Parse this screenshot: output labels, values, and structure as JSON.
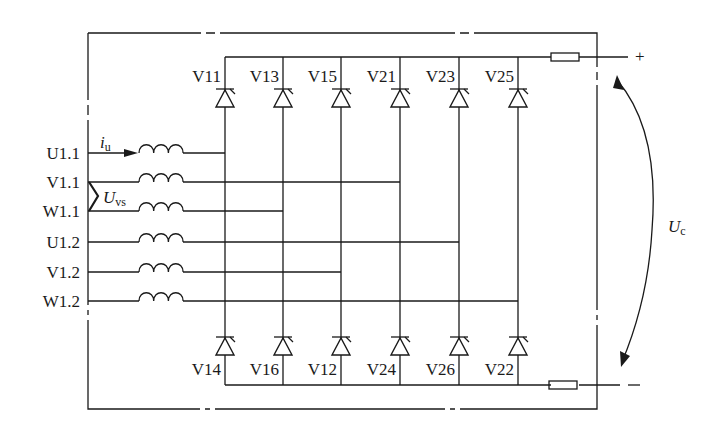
{
  "diagram": {
    "type": "twelve-pulse thyristor rectifier bridge (two parallel 6-pulse bridges)",
    "inputs": [
      {
        "label": "U1.1",
        "y": 153,
        "connects_to_column": 0
      },
      {
        "label": "V1.1",
        "y": 182,
        "connects_to_column": 3
      },
      {
        "label": "W1.1",
        "y": 211,
        "connects_to_column": 1
      },
      {
        "label": "U1.2",
        "y": 242,
        "connects_to_column": 4
      },
      {
        "label": "V1.2",
        "y": 272,
        "connects_to_column": 2
      },
      {
        "label": "W1.2",
        "y": 301,
        "connects_to_column": 5
      }
    ],
    "columns_x": [
      225,
      283,
      341,
      400,
      459,
      518
    ],
    "upper_thyristors": [
      "V11",
      "V13",
      "V15",
      "V21",
      "V23",
      "V25"
    ],
    "lower_thyristors": [
      "V14",
      "V16",
      "V12",
      "V24",
      "V26",
      "V22"
    ],
    "annotations": {
      "current_label": "i",
      "current_sub": "u",
      "voltage_vs_label": "U",
      "voltage_vs_sub": "vs",
      "dc_voltage_label": "U",
      "dc_voltage_sub": "c",
      "plus_terminal": "+",
      "minus_terminal": "-"
    },
    "colors": {
      "line": "#1a1a1a",
      "background": "#ffffff"
    }
  }
}
